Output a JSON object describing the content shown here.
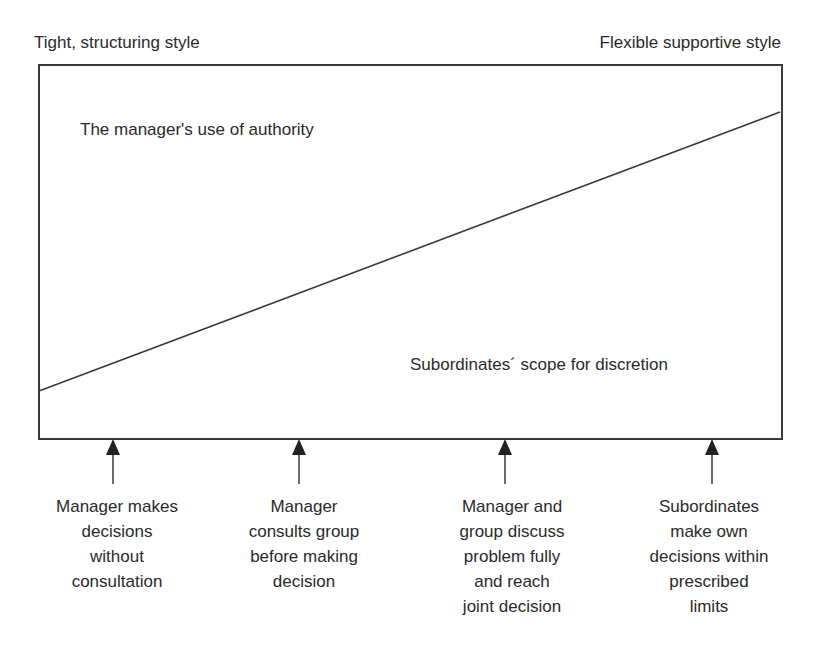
{
  "diagram": {
    "title_left": "Tight, structuring style",
    "title_right": "Flexible supportive style",
    "region_upper_label": "The manager's use of authority",
    "region_lower_label": "Subordinates´ scope for discretion",
    "divider_line": {
      "start": [
        38,
        391
      ],
      "end": [
        781,
        112
      ]
    },
    "stroke_color": "#3a3a3a",
    "positions": [
      {
        "x": 113,
        "caption_lines": [
          "Manager makes",
          "decisions",
          "without",
          "consultation"
        ]
      },
      {
        "x": 299,
        "caption_lines": [
          "Manager",
          "consults group",
          "before making",
          "decision"
        ]
      },
      {
        "x": 505,
        "caption_lines": [
          "Manager and",
          "group discuss",
          "problem fully",
          "and reach",
          "joint decision"
        ]
      },
      {
        "x": 712,
        "caption_lines": [
          "Subordinates",
          "make own",
          "decisions within",
          "prescribed",
          "limits"
        ]
      }
    ]
  }
}
